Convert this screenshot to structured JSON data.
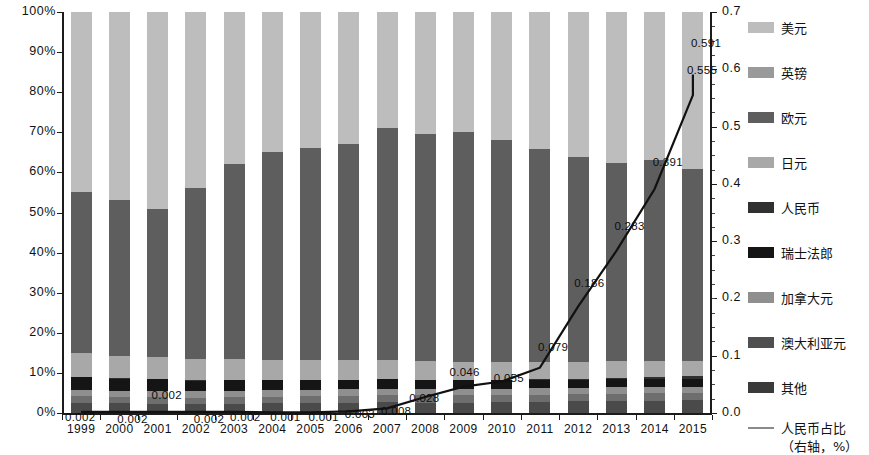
{
  "chart_data": {
    "type": "bar",
    "subtype": "stacked-bar-100-percent-with-line-overlay",
    "title": "",
    "xlabel": "",
    "ylabel": "",
    "ylabel_right": "",
    "grid": false,
    "legend_position": "right",
    "categories": [
      "1999",
      "2000",
      "2001",
      "2002",
      "2003",
      "2004",
      "2005",
      "2006",
      "2007",
      "2008",
      "2009",
      "2010",
      "2011",
      "2012",
      "2013",
      "2014",
      "2015"
    ],
    "ylim": [
      0,
      100
    ],
    "ytick_labels": [
      "0%",
      "10%",
      "20%",
      "30%",
      "40%",
      "50%",
      "60%",
      "70%",
      "80%",
      "90%",
      "100%"
    ],
    "ytick_values": [
      0,
      10,
      20,
      30,
      40,
      50,
      60,
      70,
      80,
      90,
      100
    ],
    "ylim_right": [
      0.0,
      0.7
    ],
    "ytick_labels_right": [
      "0.0",
      "0.1",
      "0.2",
      "0.3",
      "0.4",
      "0.5",
      "0.6",
      "0.7"
    ],
    "ytick_values_right": [
      0.0,
      0.1,
      0.2,
      0.3,
      0.4,
      0.5,
      0.6,
      0.7
    ],
    "series": [
      {
        "name": "其他",
        "color": "#4a4a4a",
        "stack_order": 1,
        "values": [
          2.6,
          2.4,
          2.3,
          2.2,
          2.3,
          2.4,
          2.5,
          2.6,
          2.7,
          2.6,
          2.6,
          2.7,
          2.8,
          2.9,
          3.0,
          3.1,
          3.2
        ]
      },
      {
        "name": "澳大利亚元",
        "color": "#6e6e6e",
        "stack_order": 2,
        "values": [
          1.6,
          1.6,
          1.6,
          1.6,
          1.7,
          1.7,
          1.7,
          1.7,
          1.8,
          1.8,
          1.8,
          1.8,
          1.8,
          1.8,
          1.8,
          1.8,
          1.8
        ]
      },
      {
        "name": "加拿大元",
        "color": "#8f8f8f",
        "stack_order": 3,
        "values": [
          1.6,
          1.6,
          1.6,
          1.6,
          1.6,
          1.6,
          1.6,
          1.6,
          1.6,
          1.6,
          1.6,
          1.6,
          1.6,
          1.6,
          1.6,
          1.6,
          1.6
        ]
      },
      {
        "name": "瑞士法郎",
        "color": "#151515",
        "stack_order": 4,
        "values": [
          3.3,
          3.1,
          3.0,
          2.8,
          2.7,
          2.6,
          2.5,
          2.4,
          2.4,
          2.3,
          2.3,
          2.2,
          2.2,
          2.1,
          2.1,
          2.0,
          2.0
        ]
      },
      {
        "name": "人民币",
        "color": "#303030",
        "stack_order": 5,
        "values": [
          0.002,
          0.002,
          0.002,
          0.002,
          0.002,
          0.001,
          0.001,
          0.003,
          0.008,
          0.028,
          0.046,
          0.055,
          0.079,
          0.186,
          0.283,
          0.391,
          0.555
        ]
      },
      {
        "name": "日元",
        "color": "#a8a8a8",
        "stack_order": 6,
        "values": [
          5.8,
          5.6,
          5.5,
          5.3,
          5.1,
          5.0,
          4.9,
          4.8,
          4.7,
          4.6,
          4.5,
          4.4,
          4.3,
          4.2,
          4.1,
          4.0,
          3.9
        ]
      },
      {
        "name": "欧元",
        "color": "#5e5e5e",
        "stack_order": 7,
        "values": [
          40.1,
          38.7,
          37.0,
          42.5,
          48.6,
          51.7,
          52.7,
          53.9,
          57.8,
          57.1,
          57.2,
          55.3,
          53.1,
          51.0,
          49.4,
          50.2,
          47.9
        ]
      },
      {
        "name": "英镑",
        "color": "#777777",
        "stack_order": 8,
        "values": [
          0.0,
          0.0,
          0.0,
          0.0,
          0.0,
          0.0,
          0.0,
          0.0,
          0.0,
          0.0,
          0.0,
          0.0,
          0.0,
          0.0,
          0.0,
          0.0,
          0.0
        ]
      },
      {
        "name": "美元",
        "color": "#bdbdbd",
        "stack_order": 9,
        "values": [
          45.0,
          47.0,
          49.0,
          44.0,
          38.0,
          35.0,
          34.0,
          33.0,
          29.0,
          30.5,
          30.0,
          32.0,
          34.2,
          36.2,
          37.8,
          36.9,
          39.2
        ]
      }
    ],
    "line_series": {
      "name": "人民币占比",
      "sublabel": "（右轴，%）",
      "color": "#111111",
      "axis": "right",
      "values": [
        0.002,
        0.002,
        0.002,
        0.002,
        0.002,
        0.001,
        0.001,
        0.003,
        0.008,
        0.028,
        0.046,
        0.055,
        0.079,
        0.186,
        0.283,
        0.391,
        0.555,
        0.591
      ],
      "points": [
        {
          "year": "1999",
          "value": 0.002,
          "label": "0.002"
        },
        {
          "year": "2000",
          "value": 0.002,
          "label": "0.002"
        },
        {
          "year": "2001",
          "value": 0.002,
          "label": "0.002"
        },
        {
          "year": "2002",
          "value": 0.002,
          "label": "0.002"
        },
        {
          "year": "2003",
          "value": 0.002,
          "label": "0.002"
        },
        {
          "year": "2004",
          "value": 0.001,
          "label": "0.001"
        },
        {
          "year": "2005",
          "value": 0.001,
          "label": "0.001"
        },
        {
          "year": "2006",
          "value": 0.003,
          "label": "0.003"
        },
        {
          "year": "2007",
          "value": 0.008,
          "label": "0.008"
        },
        {
          "year": "2008",
          "value": 0.028,
          "label": "0.028"
        },
        {
          "year": "2009",
          "value": 0.046,
          "label": "0.046"
        },
        {
          "year": "2010",
          "value": 0.055,
          "label": "0.055"
        },
        {
          "year": "2011",
          "value": 0.079,
          "label": "0.079"
        },
        {
          "year": "2012",
          "value": 0.186,
          "label": "0.186"
        },
        {
          "year": "2013",
          "value": 0.283,
          "label": "0.283"
        },
        {
          "year": "2014",
          "value": 0.391,
          "label": "0.391"
        },
        {
          "year": "2015",
          "value": 0.555,
          "label": "0.555"
        },
        {
          "year": "2015",
          "value": 0.591,
          "label": "0.591"
        }
      ]
    }
  },
  "legend": {
    "items": [
      {
        "label": "美元",
        "color": "#bdbdbd"
      },
      {
        "label": "英镑",
        "color": "#9a9a9a"
      },
      {
        "label": "欧元",
        "color": "#5e5e5e"
      },
      {
        "label": "日元",
        "color": "#a8a8a8"
      },
      {
        "label": "人民币",
        "color": "#303030"
      },
      {
        "label": "瑞士法郎",
        "color": "#151515"
      },
      {
        "label": "加拿大元",
        "color": "#8f8f8f"
      },
      {
        "label": "澳大利亚元",
        "color": "#4f4f4f"
      },
      {
        "label": "其他",
        "color": "#3a3a3a"
      }
    ],
    "line_label": "人民币占比",
    "line_sublabel": "（右轴，%）",
    "line_color": "#8a8a8a"
  }
}
